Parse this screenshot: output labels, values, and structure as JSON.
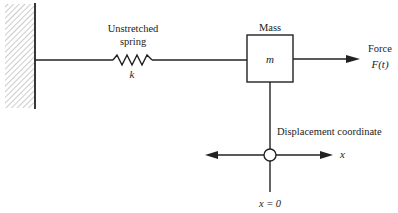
{
  "diagram": {
    "type": "mass-spring system",
    "spring": {
      "label_line1": "Unstretched",
      "label_line2": "spring",
      "constant": "k"
    },
    "mass": {
      "title": "Mass",
      "symbol": "m"
    },
    "force": {
      "label": "Force",
      "symbol": "F(t)"
    },
    "coordinate": {
      "label": "Displacement coordinate",
      "axis": "x",
      "origin": "x = 0"
    },
    "colors": {
      "line": "#222222",
      "hatch": "#9a9a9a",
      "background": "#ffffff"
    }
  }
}
